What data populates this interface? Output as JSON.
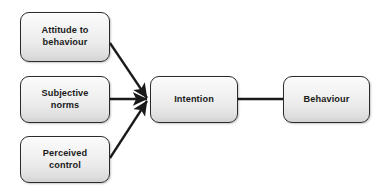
{
  "diagram": {
    "background_color": "#ffffff",
    "node_border_color": "#2b2b2b",
    "node_fill_top_color": "#fbfbfb",
    "node_fill_bottom_color": "#d2d2d2",
    "edge_color": "#1a1a1a",
    "nodes": [
      {
        "id": "attitude",
        "label": "Attitude to\nbehaviour"
      },
      {
        "id": "subjective",
        "label": "Subjective\nnorms"
      },
      {
        "id": "perceived",
        "label": "Perceived\ncontrol"
      },
      {
        "id": "intention",
        "label": "Intention"
      },
      {
        "id": "behaviour",
        "label": "Behaviour"
      }
    ],
    "edges": [
      {
        "id": "attitude-to-intention",
        "from": "attitude",
        "to": "intention",
        "arrow": true
      },
      {
        "id": "subjective-to-intention",
        "from": "subjective",
        "to": "intention",
        "arrow": true
      },
      {
        "id": "perceived-to-intention",
        "from": "perceived",
        "to": "intention",
        "arrow": true
      },
      {
        "id": "intention-to-behaviour",
        "from": "intention",
        "to": "behaviour",
        "arrow": false
      }
    ]
  }
}
